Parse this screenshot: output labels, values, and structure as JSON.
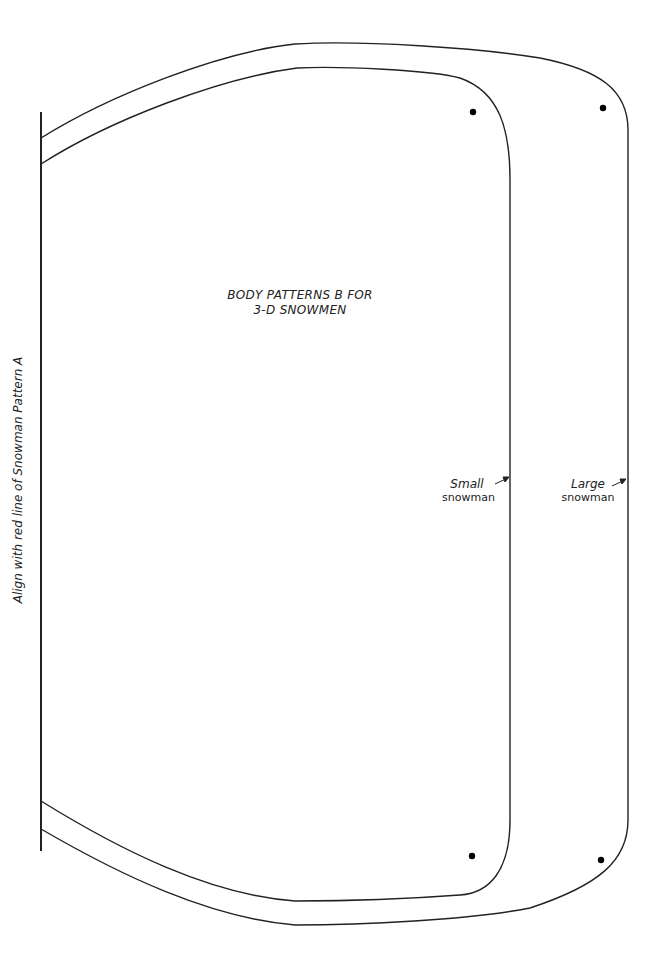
{
  "document": {
    "title_line1": "BODY PATTERNS B FOR",
    "title_line2": "3-D SNOWMEN",
    "side_instruction": "Align with red line of Snowman Pattern A",
    "labels": {
      "small": {
        "line1": "Small",
        "line2": "snowman"
      },
      "large": {
        "line1": "Large",
        "line2": "snowman"
      }
    },
    "colors": {
      "line": "#222222",
      "background": "#ffffff"
    }
  }
}
